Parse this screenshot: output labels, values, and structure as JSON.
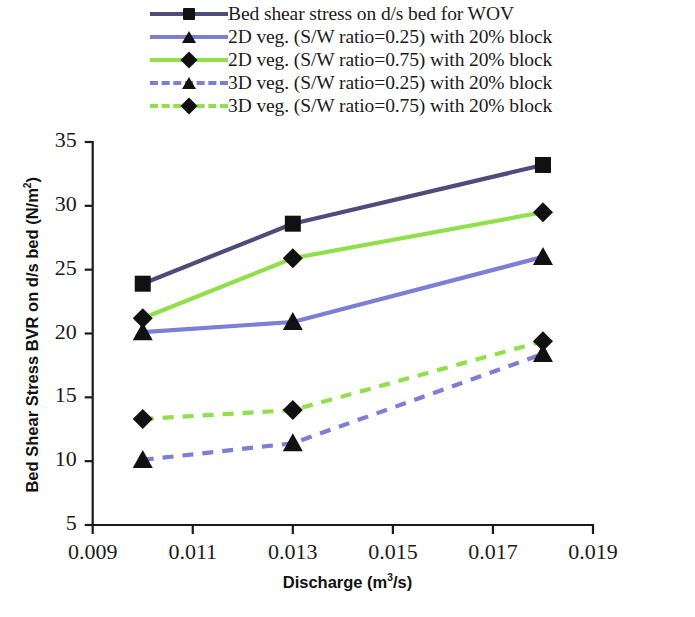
{
  "chart_data": {
    "type": "line",
    "title": "",
    "xlabel": "Discharge (m3/s)",
    "ylabel": "Bed Shear Stress BVR on d/s bed (N/m2)",
    "xlim": [
      0.009,
      0.019
    ],
    "ylim": [
      5,
      35
    ],
    "xticks": [
      "0.009",
      "0.011",
      "0.013",
      "0.015",
      "0.017",
      "0.019"
    ],
    "xtick_values": [
      0.009,
      0.011,
      0.013,
      0.015,
      0.017,
      0.019
    ],
    "yticks": [
      "5",
      "10",
      "15",
      "20",
      "25",
      "30",
      "35"
    ],
    "ytick_values": [
      5,
      10,
      15,
      20,
      25,
      30,
      35
    ],
    "grid": false,
    "legend_position": "top",
    "x": [
      0.01,
      0.013,
      0.018
    ],
    "series": [
      {
        "name": "Bed shear stress on d/s bed for WOV",
        "values": [
          23.9,
          28.6,
          33.2
        ],
        "color": "#4f4b7a",
        "marker": "square",
        "dashed": false
      },
      {
        "name": "2D veg. (S/W ratio=0.25) with 20% block",
        "values": [
          20.1,
          20.9,
          26.0
        ],
        "color": "#7b7fd6",
        "marker": "triangle",
        "dashed": false
      },
      {
        "name": "2D veg. (S/W ratio=0.75) with 20% block",
        "values": [
          21.2,
          25.9,
          29.5
        ],
        "color": "#8fe04a",
        "marker": "diamond",
        "dashed": false
      },
      {
        "name": "3D veg. (S/W ratio=0.25) with 20% block",
        "values": [
          10.1,
          11.4,
          18.4
        ],
        "color": "#7b7fd6",
        "marker": "triangle",
        "dashed": true
      },
      {
        "name": "3D veg. (S/W ratio=0.75) with 20% block",
        "values": [
          13.3,
          14.0,
          19.4
        ],
        "color": "#8fe04a",
        "marker": "diamond",
        "dashed": true
      }
    ]
  },
  "axis": {
    "y_title_main": "Bed Shear Stress BVR on d/s bed (N/m",
    "y_title_sup": "2",
    "y_title_close": ")",
    "x_title_main": "Discharge (m",
    "x_title_sup": "3",
    "x_title_close": "/s)"
  },
  "legend": {
    "items": [
      {
        "label": "Bed shear stress on d/s bed for WOV",
        "color": "#4f4b7a",
        "marker": "square",
        "dashed": false
      },
      {
        "label": "2D veg. (S/W ratio=0.25) with 20% block",
        "color": "#7b7fd6",
        "marker": "triangle",
        "dashed": false
      },
      {
        "label": "2D veg. (S/W ratio=0.75) with 20% block",
        "color": "#8fe04a",
        "marker": "diamond",
        "dashed": false
      },
      {
        "label": "3D veg. (S/W ratio=0.25) with 20% block",
        "color": "#7b7fd6",
        "marker": "triangle",
        "dashed": true
      },
      {
        "label": "3D veg. (S/W ratio=0.75) with 20% block",
        "color": "#8fe04a",
        "marker": "diamond",
        "dashed": true
      }
    ]
  }
}
